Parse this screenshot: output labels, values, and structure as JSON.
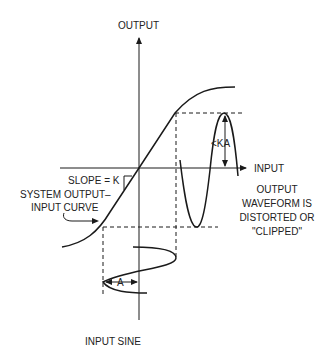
{
  "diagram": {
    "axes": {
      "y_label": "OUTPUT",
      "x_label": "INPUT"
    },
    "labels": {
      "slope": "SLOPE = K",
      "curve_line1": "SYSTEM OUTPUT–",
      "curve_line2": "INPUT CURVE",
      "ka": "<KA",
      "amplitude": "A",
      "output_line1": "OUTPUT",
      "output_line2": "WAVEFORM IS",
      "output_line3": "DISTORTED OR",
      "output_line4": "\"CLIPPED\"",
      "input_sine": "INPUT SINE"
    },
    "colors": {
      "ink": "#1a1a1a",
      "background": "#ffffff"
    }
  }
}
